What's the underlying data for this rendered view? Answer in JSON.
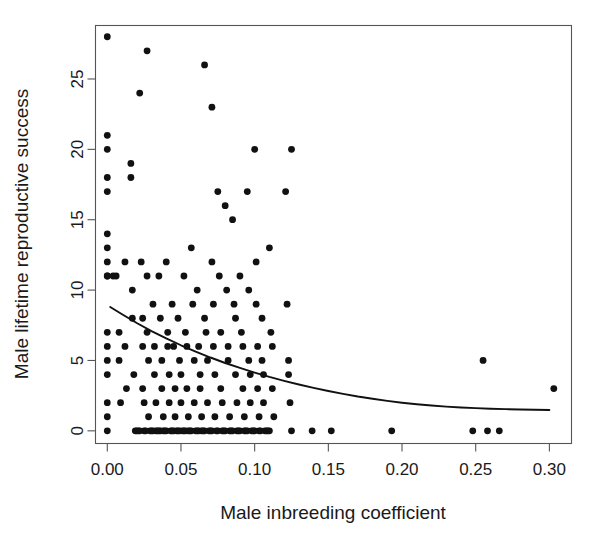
{
  "chart_data": {
    "type": "scatter",
    "title": "",
    "xlabel": "Male inbreeding coefficient",
    "ylabel": "Male lifetime reproductive success",
    "xlim": [
      -0.008,
      0.315
    ],
    "ylim": [
      -0.9,
      28.8
    ],
    "xticks": [
      0.0,
      0.05,
      0.1,
      0.15,
      0.2,
      0.25,
      0.3
    ],
    "xtick_labels": [
      "0.00",
      "0.05",
      "0.10",
      "0.15",
      "0.20",
      "0.25",
      "0.30"
    ],
    "yticks": [
      0,
      5,
      10,
      15,
      20,
      25
    ],
    "ytick_labels": [
      "0",
      "5",
      "10",
      "15",
      "20",
      "25"
    ],
    "grid": false,
    "legend": null,
    "point_color": "#111111",
    "point_radius": 3.4,
    "line_color": "#111111",
    "series": [
      {
        "name": "Males",
        "marker": "filled-circle",
        "points": [
          [
            0.0,
            28
          ],
          [
            0.0,
            21
          ],
          [
            0.0,
            20
          ],
          [
            0.0,
            18
          ],
          [
            0.0,
            17
          ],
          [
            0.0,
            14
          ],
          [
            0.0,
            13
          ],
          [
            0.0,
            12
          ],
          [
            0.0,
            11
          ],
          [
            0.0,
            11
          ],
          [
            0.0,
            7
          ],
          [
            0.0,
            6
          ],
          [
            0.0,
            5
          ],
          [
            0.0,
            4
          ],
          [
            0.0,
            2
          ],
          [
            0.0,
            1
          ],
          [
            0.0,
            0
          ],
          [
            0.004,
            11
          ],
          [
            0.006,
            11
          ],
          [
            0.008,
            7
          ],
          [
            0.008,
            5
          ],
          [
            0.009,
            2
          ],
          [
            0.012,
            12
          ],
          [
            0.012,
            6
          ],
          [
            0.013,
            3
          ],
          [
            0.016,
            19
          ],
          [
            0.016,
            18
          ],
          [
            0.017,
            10
          ],
          [
            0.017,
            8
          ],
          [
            0.018,
            4
          ],
          [
            0.019,
            0
          ],
          [
            0.02,
            0
          ],
          [
            0.021,
            0
          ],
          [
            0.022,
            0
          ],
          [
            0.022,
            24
          ],
          [
            0.023,
            12
          ],
          [
            0.024,
            8
          ],
          [
            0.024,
            6
          ],
          [
            0.024,
            3
          ],
          [
            0.025,
            2
          ],
          [
            0.025,
            0
          ],
          [
            0.026,
            0
          ],
          [
            0.027,
            27
          ],
          [
            0.027,
            11
          ],
          [
            0.027,
            7
          ],
          [
            0.028,
            5
          ],
          [
            0.028,
            1
          ],
          [
            0.029,
            0
          ],
          [
            0.03,
            0
          ],
          [
            0.031,
            0
          ],
          [
            0.031,
            9
          ],
          [
            0.032,
            6
          ],
          [
            0.032,
            4
          ],
          [
            0.033,
            2
          ],
          [
            0.033,
            0
          ],
          [
            0.034,
            0
          ],
          [
            0.035,
            0
          ],
          [
            0.036,
            0
          ],
          [
            0.035,
            11
          ],
          [
            0.036,
            8
          ],
          [
            0.037,
            5
          ],
          [
            0.037,
            3
          ],
          [
            0.038,
            1
          ],
          [
            0.038,
            0
          ],
          [
            0.039,
            0
          ],
          [
            0.04,
            0
          ],
          [
            0.04,
            12
          ],
          [
            0.041,
            7
          ],
          [
            0.041,
            6
          ],
          [
            0.042,
            4
          ],
          [
            0.042,
            2
          ],
          [
            0.043,
            0
          ],
          [
            0.044,
            0
          ],
          [
            0.045,
            0
          ],
          [
            0.044,
            9
          ],
          [
            0.045,
            6
          ],
          [
            0.046,
            3
          ],
          [
            0.046,
            1
          ],
          [
            0.047,
            0
          ],
          [
            0.048,
            0
          ],
          [
            0.049,
            0
          ],
          [
            0.048,
            8
          ],
          [
            0.049,
            5
          ],
          [
            0.05,
            4
          ],
          [
            0.05,
            2
          ],
          [
            0.051,
            0
          ],
          [
            0.052,
            0
          ],
          [
            0.053,
            0
          ],
          [
            0.052,
            11
          ],
          [
            0.053,
            7
          ],
          [
            0.054,
            6
          ],
          [
            0.054,
            3
          ],
          [
            0.055,
            1
          ],
          [
            0.055,
            0
          ],
          [
            0.056,
            0
          ],
          [
            0.057,
            0
          ],
          [
            0.057,
            13
          ],
          [
            0.058,
            9
          ],
          [
            0.059,
            5
          ],
          [
            0.059,
            2
          ],
          [
            0.06,
            0
          ],
          [
            0.061,
            0
          ],
          [
            0.062,
            0
          ],
          [
            0.061,
            10
          ],
          [
            0.062,
            6
          ],
          [
            0.063,
            4
          ],
          [
            0.063,
            3
          ],
          [
            0.064,
            1
          ],
          [
            0.064,
            0
          ],
          [
            0.065,
            0
          ],
          [
            0.066,
            0
          ],
          [
            0.066,
            26
          ],
          [
            0.066,
            8
          ],
          [
            0.067,
            7
          ],
          [
            0.068,
            5
          ],
          [
            0.068,
            2
          ],
          [
            0.069,
            0
          ],
          [
            0.07,
            0
          ],
          [
            0.071,
            0
          ],
          [
            0.071,
            23
          ],
          [
            0.071,
            12
          ],
          [
            0.072,
            9
          ],
          [
            0.072,
            6
          ],
          [
            0.073,
            4
          ],
          [
            0.073,
            1
          ],
          [
            0.074,
            0
          ],
          [
            0.075,
            0
          ],
          [
            0.075,
            17
          ],
          [
            0.076,
            11
          ],
          [
            0.077,
            7
          ],
          [
            0.077,
            3
          ],
          [
            0.078,
            2
          ],
          [
            0.078,
            0
          ],
          [
            0.079,
            0
          ],
          [
            0.08,
            0
          ],
          [
            0.08,
            16
          ],
          [
            0.081,
            10
          ],
          [
            0.082,
            6
          ],
          [
            0.082,
            5
          ],
          [
            0.083,
            1
          ],
          [
            0.083,
            0
          ],
          [
            0.084,
            0
          ],
          [
            0.085,
            0
          ],
          [
            0.085,
            15
          ],
          [
            0.086,
            9
          ],
          [
            0.087,
            8
          ],
          [
            0.087,
            4
          ],
          [
            0.088,
            2
          ],
          [
            0.088,
            0
          ],
          [
            0.089,
            0
          ],
          [
            0.09,
            0
          ],
          [
            0.09,
            11
          ],
          [
            0.091,
            7
          ],
          [
            0.092,
            6
          ],
          [
            0.092,
            3
          ],
          [
            0.093,
            1
          ],
          [
            0.093,
            0
          ],
          [
            0.094,
            0
          ],
          [
            0.095,
            0
          ],
          [
            0.095,
            17
          ],
          [
            0.096,
            10
          ],
          [
            0.096,
            5
          ],
          [
            0.097,
            4
          ],
          [
            0.097,
            2
          ],
          [
            0.098,
            0
          ],
          [
            0.099,
            0
          ],
          [
            0.1,
            0
          ],
          [
            0.1,
            20
          ],
          [
            0.101,
            12
          ],
          [
            0.101,
            9
          ],
          [
            0.102,
            6
          ],
          [
            0.102,
            3
          ],
          [
            0.103,
            1
          ],
          [
            0.103,
            0
          ],
          [
            0.104,
            0
          ],
          [
            0.105,
            8
          ],
          [
            0.105,
            5
          ],
          [
            0.106,
            4
          ],
          [
            0.106,
            2
          ],
          [
            0.107,
            0
          ],
          [
            0.108,
            0
          ],
          [
            0.109,
            0
          ],
          [
            0.11,
            0
          ],
          [
            0.11,
            13
          ],
          [
            0.111,
            7
          ],
          [
            0.112,
            6
          ],
          [
            0.112,
            3
          ],
          [
            0.113,
            1
          ],
          [
            0.121,
            17
          ],
          [
            0.122,
            9
          ],
          [
            0.123,
            5
          ],
          [
            0.123,
            4
          ],
          [
            0.124,
            2
          ],
          [
            0.125,
            20
          ],
          [
            0.125,
            0
          ],
          [
            0.139,
            0
          ],
          [
            0.152,
            0
          ],
          [
            0.193,
            0
          ],
          [
            0.248,
            0
          ],
          [
            0.255,
            5
          ],
          [
            0.258,
            0
          ],
          [
            0.266,
            0
          ],
          [
            0.303,
            3
          ]
        ]
      }
    ],
    "fit_curve": {
      "name": "fitted exponential decline",
      "color": "#111111",
      "points": [
        [
          0.002,
          8.8
        ],
        [
          0.01,
          8.28
        ],
        [
          0.02,
          7.66
        ],
        [
          0.03,
          7.09
        ],
        [
          0.04,
          6.57
        ],
        [
          0.05,
          6.08
        ],
        [
          0.06,
          5.63
        ],
        [
          0.07,
          5.21
        ],
        [
          0.08,
          4.82
        ],
        [
          0.09,
          4.47
        ],
        [
          0.1,
          4.14
        ],
        [
          0.11,
          3.83
        ],
        [
          0.12,
          3.55
        ],
        [
          0.13,
          3.29
        ],
        [
          0.14,
          3.05
        ],
        [
          0.15,
          2.83
        ],
        [
          0.16,
          2.63
        ],
        [
          0.17,
          2.44
        ],
        [
          0.18,
          2.28
        ],
        [
          0.19,
          2.13
        ],
        [
          0.2,
          2.0
        ],
        [
          0.21,
          1.89
        ],
        [
          0.22,
          1.8
        ],
        [
          0.23,
          1.72
        ],
        [
          0.24,
          1.66
        ],
        [
          0.25,
          1.61
        ],
        [
          0.26,
          1.57
        ],
        [
          0.27,
          1.54
        ],
        [
          0.28,
          1.52
        ],
        [
          0.29,
          1.5
        ],
        [
          0.3,
          1.48
        ]
      ]
    }
  },
  "figure": {
    "background_color": "#ffffff",
    "frame_color": "#555555"
  }
}
